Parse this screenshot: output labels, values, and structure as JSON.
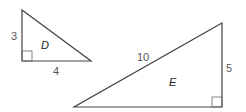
{
  "triangles": [
    {
      "name": "D",
      "sides": {
        "vertical": "3",
        "horizontal": "4"
      }
    },
    {
      "name": "E",
      "sides": {
        "hypotenuse": "10",
        "vertical": "5"
      }
    }
  ],
  "colors": {
    "stroke": "#444444",
    "label": "#555555"
  }
}
